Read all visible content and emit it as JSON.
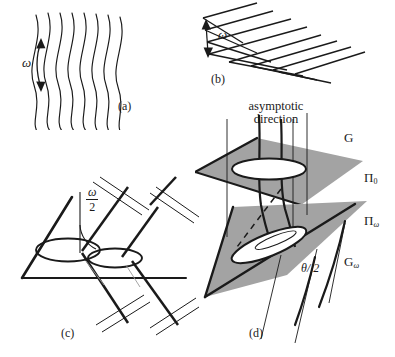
{
  "figure": {
    "width": 395,
    "height": 357,
    "background": "#ffffff",
    "ink": "#1a1a1a",
    "plane_fill": "#a3a3a3"
  },
  "panels": [
    {
      "id": "a",
      "label": "(a)",
      "caption_desc": "wavy parallel lines with omega angular spread",
      "angle_label": "ω"
    },
    {
      "id": "b",
      "label": "(b)",
      "caption_desc": "chevron V-shaped lines with omega opening angle",
      "angle_label": "ω"
    },
    {
      "id": "c",
      "label": "(c)",
      "caption_desc": "plane with two ellipses and crossing line pairs",
      "angle_numerator": "ω",
      "angle_denominator": "2"
    },
    {
      "id": "d",
      "label": "(d)",
      "caption_desc": "two planes with ellipses, asymptotic direction and great circles",
      "asymptotic_line1": "asymptotic",
      "asymptotic_line2": "direction",
      "label_G": "G",
      "label_Pi0_base": "Π",
      "label_Pi0_sub": "0",
      "label_Piw_base": "Π",
      "label_Piw_sub": "ω",
      "label_Gw_base": "G",
      "label_Gw_sub": "ω",
      "angle_label": "θ/ 2"
    }
  ]
}
